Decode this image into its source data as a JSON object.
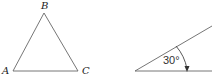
{
  "figures": {
    "triangle": {
      "vertices": {
        "A": {
          "label": "A"
        },
        "B": {
          "label": "B"
        },
        "C": {
          "label": "C"
        }
      }
    },
    "angle": {
      "value_label": "30°",
      "degrees": 30
    }
  },
  "colors": {
    "stroke": "#555555",
    "text": "#222222"
  }
}
